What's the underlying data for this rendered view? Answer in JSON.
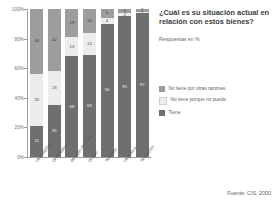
{
  "header": {
    "title": "¿Cuál es su situación actual en relación con estos bienes?",
    "subtitle": "Respuestas en %"
  },
  "source": {
    "text": "Fuente: CIS, 2000"
  },
  "legend": {
    "items": [
      {
        "label": "No tiene por otras razones.",
        "color": "#9d9d9d",
        "key": "other"
      },
      {
        "label": "No tiene porque no puede.",
        "color": "#ececec",
        "key": "cannot"
      },
      {
        "label": "Tiene.",
        "color": "#6f6f6f",
        "key": "has"
      }
    ]
  },
  "axis": {
    "yticks": [
      "100%",
      "80%",
      "60%",
      "40%",
      "20%",
      "0%"
    ]
  },
  "chart_data": {
    "type": "bar",
    "title": "¿Cuál es su situación actual en relación con estos bienes?",
    "subtitle": "Respuestas en %",
    "xlabel": "",
    "ylabel": "",
    "ylim": [
      0,
      100
    ],
    "stacked": true,
    "grid": false,
    "legend_position": "right",
    "categories": [
      "Lavavajillas",
      "Ordenador",
      "Aparato de vídeo",
      "Coche",
      "Teléfono",
      "Lavadora",
      "Televisión"
    ],
    "series": [
      {
        "name": "No tiene por otras razones.",
        "color": "#9d9d9d",
        "values": [
          44,
          42,
          19,
          16,
          6,
          3,
          2
        ]
      },
      {
        "name": "No tiene porque no puede.",
        "color": "#ececec",
        "values": [
          35,
          23,
          13,
          15,
          4,
          2,
          1
        ]
      },
      {
        "name": "Tiene.",
        "color": "#6f6f6f",
        "values": [
          21,
          35,
          68,
          69,
          90,
          95,
          97
        ]
      }
    ]
  }
}
